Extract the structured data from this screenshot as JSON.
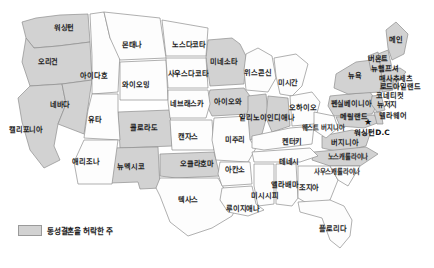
{
  "map": {
    "title": "미국 주별 지도",
    "background_color": "#ffffff",
    "shaded_color": "#d2d2d2",
    "plain_color": "#fdfdfd",
    "border_color": "#8e8e8e",
    "label_color": "#1d1d1d"
  },
  "legend": {
    "swatch_color": "#d2d2d2",
    "text": "동성결혼을 허락한 주"
  },
  "capital": {
    "marker_glyph": "★",
    "label": "워싱턴D.C"
  },
  "states": [
    {
      "name": "워싱턴",
      "shaded": true,
      "x": 64,
      "y": 28
    },
    {
      "name": "오리건",
      "shaded": true,
      "x": 48,
      "y": 62
    },
    {
      "name": "캘리포니아",
      "shaded": true,
      "x": 26,
      "y": 130
    },
    {
      "name": "네바다",
      "shaded": true,
      "x": 60,
      "y": 105
    },
    {
      "name": "아이다호",
      "shaded": false,
      "x": 94,
      "y": 76
    },
    {
      "name": "몬태나",
      "shaded": false,
      "x": 132,
      "y": 45
    },
    {
      "name": "와이오밍",
      "shaded": false,
      "x": 136,
      "y": 85
    },
    {
      "name": "유타",
      "shaded": false,
      "x": 95,
      "y": 120
    },
    {
      "name": "콜로라도",
      "shaded": true,
      "x": 144,
      "y": 128
    },
    {
      "name": "애리조나",
      "shaded": false,
      "x": 86,
      "y": 162
    },
    {
      "name": "뉴멕시코",
      "shaded": true,
      "x": 131,
      "y": 167
    },
    {
      "name": "노스다코타",
      "shaded": false,
      "x": 189,
      "y": 45
    },
    {
      "name": "사우스다코타",
      "shaded": false,
      "x": 188,
      "y": 74
    },
    {
      "name": "네브래스카",
      "shaded": false,
      "x": 187,
      "y": 104
    },
    {
      "name": "캔자스",
      "shaded": false,
      "x": 188,
      "y": 137
    },
    {
      "name": "오클라호마",
      "shaded": true,
      "x": 197,
      "y": 164
    },
    {
      "name": "텍사스",
      "shaded": false,
      "x": 188,
      "y": 200
    },
    {
      "name": "미네소타",
      "shaded": true,
      "x": 224,
      "y": 62
    },
    {
      "name": "아이오와",
      "shaded": true,
      "x": 228,
      "y": 102
    },
    {
      "name": "미주리",
      "shaded": false,
      "x": 235,
      "y": 140
    },
    {
      "name": "아칸소",
      "shaded": false,
      "x": 235,
      "y": 170
    },
    {
      "name": "루이지애나",
      "shaded": false,
      "x": 243,
      "y": 209
    },
    {
      "name": "위스콘신",
      "shaded": false,
      "x": 258,
      "y": 73
    },
    {
      "name": "일리노이",
      "shaded": true,
      "x": 253,
      "y": 118
    },
    {
      "name": "인디애나",
      "shaded": true,
      "x": 281,
      "y": 118
    },
    {
      "name": "미시간",
      "shaded": false,
      "x": 288,
      "y": 83
    },
    {
      "name": "오하이오",
      "shaded": false,
      "x": 303,
      "y": 108
    },
    {
      "name": "켄터키",
      "shaded": false,
      "x": 292,
      "y": 142
    },
    {
      "name": "테네시",
      "shaded": false,
      "x": 289,
      "y": 162
    },
    {
      "name": "미시시피",
      "shaded": false,
      "x": 265,
      "y": 196
    },
    {
      "name": "앨라배마",
      "shaded": false,
      "x": 285,
      "y": 185
    },
    {
      "name": "조지아",
      "shaded": false,
      "x": 309,
      "y": 188
    },
    {
      "name": "플로리다",
      "shaded": false,
      "x": 333,
      "y": 229
    },
    {
      "name": "사우스캐롤라이나",
      "shaded": false,
      "x": 337,
      "y": 173
    },
    {
      "name": "노스캐롤라이나",
      "shaded": true,
      "x": 348,
      "y": 158
    },
    {
      "name": "버지니아",
      "shaded": true,
      "x": 345,
      "y": 143
    },
    {
      "name": "웨스트\n버지니아",
      "shaded": false,
      "x": 323,
      "y": 129
    },
    {
      "name": "펜실베이니아",
      "shaded": true,
      "x": 351,
      "y": 104
    },
    {
      "name": "메릴랜드",
      "shaded": true,
      "x": 354,
      "y": 117
    },
    {
      "name": "델라웨어",
      "shaded": true,
      "x": 393,
      "y": 116
    },
    {
      "name": "뉴저지",
      "shaded": true,
      "x": 387,
      "y": 105
    },
    {
      "name": "뉴욕",
      "shaded": true,
      "x": 355,
      "y": 76
    },
    {
      "name": "코네티컷",
      "shaded": true,
      "x": 390,
      "y": 96
    },
    {
      "name": "로드아일랜드",
      "shaded": true,
      "x": 400,
      "y": 87
    },
    {
      "name": "매사추세츠",
      "shaded": true,
      "x": 396,
      "y": 79
    },
    {
      "name": "뉴햄프셔",
      "shaded": true,
      "x": 385,
      "y": 69
    },
    {
      "name": "버몬트",
      "shaded": true,
      "x": 378,
      "y": 59
    },
    {
      "name": "메인",
      "shaded": true,
      "x": 396,
      "y": 40
    }
  ],
  "capital_position": {
    "star_x": 368,
    "star_y": 122,
    "label_x": 372,
    "label_y": 131
  }
}
